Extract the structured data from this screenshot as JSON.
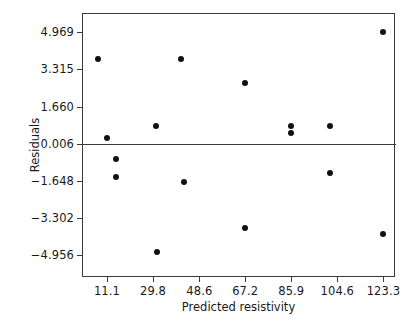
{
  "chart_data": {
    "type": "scatter",
    "title": "",
    "xlabel": "Predicted resistivity",
    "ylabel": "Residuals",
    "xticks": [
      "11.1",
      "29.8",
      "48.6",
      "67.2",
      "85.9",
      "104.6",
      "123.3"
    ],
    "xtick_values": [
      11.1,
      29.8,
      48.6,
      67.2,
      85.9,
      104.6,
      123.3
    ],
    "yticks": [
      "4.969",
      "3.315",
      "1.660",
      "0.006",
      "-1.648",
      "-3.302",
      "-4.956"
    ],
    "ytick_values": [
      4.969,
      3.315,
      1.66,
      0.006,
      -1.648,
      -3.302,
      -4.956
    ],
    "xlim": [
      1.4,
      128.4
    ],
    "ylim": [
      -5.96,
      5.77
    ],
    "grid": false,
    "legend": null,
    "reference_line": {
      "y": 0.006,
      "orientation": "horizontal"
    },
    "marker": {
      "shape": "circle",
      "color": "#111111",
      "size": 6
    },
    "points": [
      {
        "x": 7.6,
        "y": 3.76
      },
      {
        "x": 11.1,
        "y": 0.24
      },
      {
        "x": 14.6,
        "y": -0.66
      },
      {
        "x": 14.6,
        "y": -1.47
      },
      {
        "x": 31.1,
        "y": 0.81
      },
      {
        "x": 31.5,
        "y": -4.8
      },
      {
        "x": 41.0,
        "y": 3.76
      },
      {
        "x": 42.3,
        "y": -1.71
      },
      {
        "x": 67.2,
        "y": 2.7
      },
      {
        "x": 67.2,
        "y": -3.75
      },
      {
        "x": 85.9,
        "y": 0.81
      },
      {
        "x": 85.9,
        "y": 0.48
      },
      {
        "x": 101.8,
        "y": 0.81
      },
      {
        "x": 101.8,
        "y": -1.31
      },
      {
        "x": 123.3,
        "y": 4.97
      },
      {
        "x": 123.3,
        "y": -4.02
      }
    ]
  },
  "figure": {
    "background_color": "#ffffff",
    "frame_color": "#3a3a3a"
  }
}
